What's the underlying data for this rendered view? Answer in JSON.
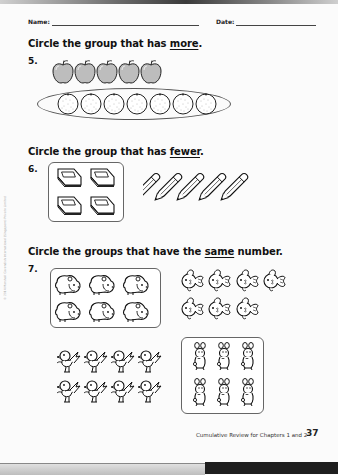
{
  "header": {
    "name_label": "Name:",
    "date_label": "Date:"
  },
  "questions": [
    {
      "number": "5.",
      "instruction_prefix": "Circle the group that has ",
      "instruction_keyword": "more",
      "instruction_suffix": ".",
      "groups": [
        {
          "item": "apple",
          "count": 5,
          "circled": false
        },
        {
          "item": "orange",
          "count": 7,
          "circled": true,
          "circle_shape": "oval"
        }
      ]
    },
    {
      "number": "6.",
      "instruction_prefix": "Circle the group that has ",
      "instruction_keyword": "fewer",
      "instruction_suffix": ".",
      "groups": [
        {
          "item": "book",
          "count": 4,
          "circled": true,
          "circle_shape": "rounded-box"
        },
        {
          "item": "pencil",
          "count": 5,
          "circled": false
        }
      ]
    },
    {
      "number": "7.",
      "instruction_prefix": "Circle the groups that have the ",
      "instruction_keyword": "same",
      "instruction_suffix": " number.",
      "groups": [
        {
          "item": "bear",
          "count": 6,
          "circled": true,
          "circle_shape": "rounded-box"
        },
        {
          "item": "fish",
          "count": 7,
          "circled": false
        },
        {
          "item": "bird",
          "count": 8,
          "circled": false
        },
        {
          "item": "rabbit",
          "count": 6,
          "circled": true,
          "circle_shape": "rounded-box"
        }
      ]
    }
  ],
  "sidebar": {
    "copyright": "© 2014 Marshall Cavendish International (Singapore) Private Limited"
  },
  "footer": {
    "title": "Cumulative Review for Chapters 1 and 2",
    "page_number": "37"
  },
  "colors": {
    "page_background": "#fbfbfb",
    "apple_fill": "#bdbdbd",
    "ink": "#111111",
    "bottom_bar_dark": "#1e1e1e"
  }
}
